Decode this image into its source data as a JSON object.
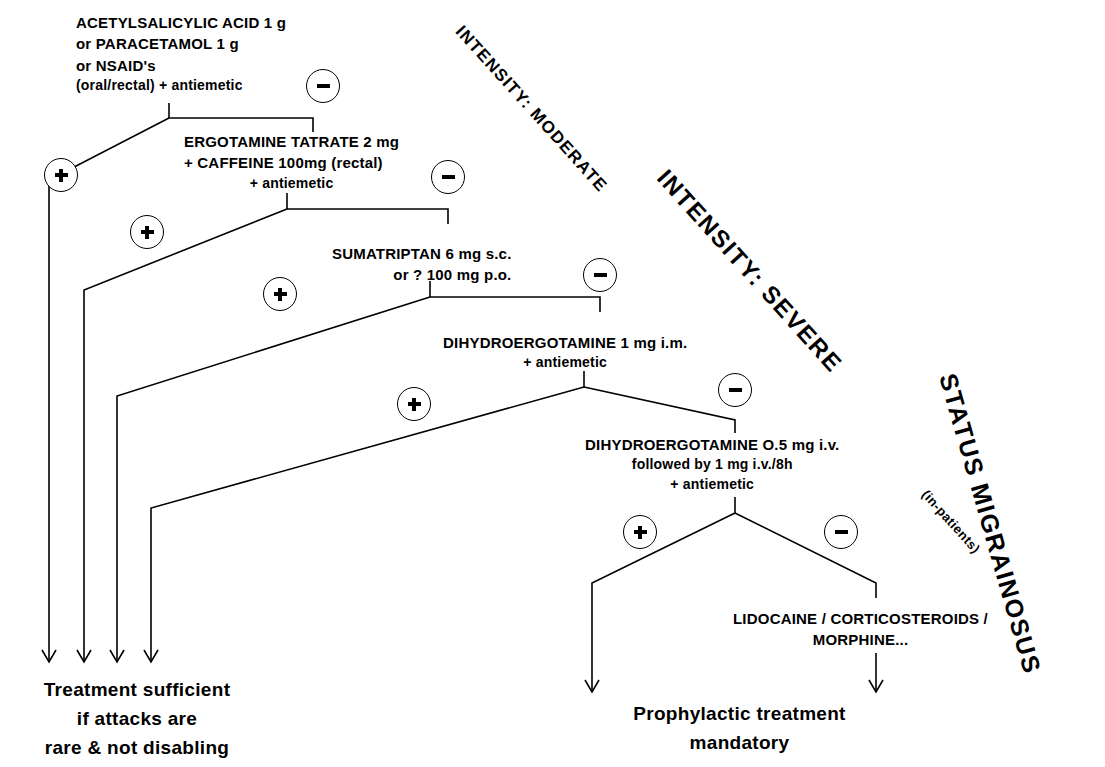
{
  "diagram": {
    "line_color": "#000000",
    "background": "#ffffff"
  },
  "steps": [
    {
      "id": "step-1",
      "lines": [
        "ACETYLSALICYLIC ACID 1 g",
        "or PARACETAMOL 1 g",
        "or NSAID's",
        "(oral/rectal) + antiemetic"
      ]
    },
    {
      "id": "step-2",
      "lines": [
        "ERGOTAMINE TATRATE 2 mg",
        "+ CAFFEINE 100mg (rectal)",
        "+ antiemetic"
      ]
    },
    {
      "id": "step-3",
      "lines": [
        "SUMATRIPTAN     6 mg  s.c.",
        "or ? 100 mg  p.o."
      ]
    },
    {
      "id": "step-4",
      "lines": [
        "DIHYDROERGOTAMINE 1 mg i.m.",
        "+ antiemetic"
      ]
    },
    {
      "id": "step-5",
      "lines": [
        "DIHYDROERGOTAMINE O.5 mg  i.v.",
        "followed by  1 mg  i.v./8h",
        "+ antiemetic"
      ]
    },
    {
      "id": "step-6",
      "lines": [
        "LIDOCAINE / CORTICOSTEROIDS /",
        "MORPHINE..."
      ]
    }
  ],
  "outcomes": {
    "sufficient": [
      "Treatment sufficient",
      "if attacks are",
      "rare & not disabling"
    ],
    "prophylactic": [
      "Prophylactic treatment",
      "mandatory"
    ]
  },
  "banners": {
    "moderate": "INTENSITY: MODERATE",
    "severe": "INTENSITY: SEVERE",
    "status_line1": "STATUS",
    "status_line2": "MIGRAINOSUS",
    "inpatients": "(in-patients)"
  },
  "signs": {
    "plus": "+",
    "minus": "−",
    "plus_name": "positive-response",
    "minus_name": "negative-response"
  },
  "icons": {
    "arrow": "arrow-down-icon",
    "plus_circle": "plus-circle-icon",
    "minus_circle": "minus-circle-icon"
  }
}
